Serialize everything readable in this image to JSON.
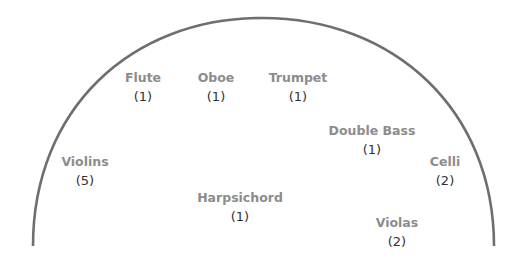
{
  "diagram": {
    "type": "orchestra-seating",
    "stage_outline_color": "#6e6e6e",
    "label_color": "#8c8c8c",
    "count_color": "#333333",
    "sections": [
      {
        "id": "flute",
        "label": "Flute",
        "count": "(1)",
        "x": 143,
        "y": 68
      },
      {
        "id": "oboe",
        "label": "Oboe",
        "count": "(1)",
        "x": 216,
        "y": 68
      },
      {
        "id": "trumpet",
        "label": "Trumpet",
        "count": "(1)",
        "x": 298,
        "y": 68
      },
      {
        "id": "double-bass",
        "label": "Double Bass",
        "count": "(1)",
        "x": 372,
        "y": 121
      },
      {
        "id": "celli",
        "label": "Celli",
        "count": "(2)",
        "x": 445,
        "y": 152
      },
      {
        "id": "violins",
        "label": "Violins",
        "count": "(5)",
        "x": 85,
        "y": 152
      },
      {
        "id": "harpsichord",
        "label": "Harpsichord",
        "count": "(1)",
        "x": 240,
        "y": 188
      },
      {
        "id": "violas",
        "label": "Violas",
        "count": "(2)",
        "x": 397,
        "y": 213
      }
    ]
  }
}
